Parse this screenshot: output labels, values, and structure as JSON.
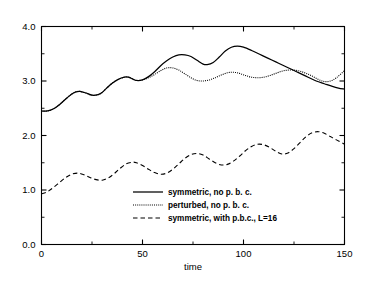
{
  "chart_data": {
    "type": "line",
    "title": "",
    "xlabel": "time",
    "ylabel": "",
    "xlim": [
      0,
      150
    ],
    "ylim": [
      0,
      4.0
    ],
    "grid": false,
    "legend_position": "lower-center",
    "x_ticks": [
      0,
      50,
      100,
      150
    ],
    "x_tick_labels": [
      "0",
      "50",
      "100",
      "150"
    ],
    "x_minor_ticks": [
      25,
      75,
      125
    ],
    "y_ticks": [
      0.0,
      1.0,
      2.0,
      3.0,
      4.0
    ],
    "y_tick_labels": [
      "0.0",
      "1.0",
      "2.0",
      "3.0",
      "4.0"
    ],
    "y_minor_ticks": [
      0.5,
      1.5,
      2.5,
      3.5
    ],
    "series": [
      {
        "name": "symmetric, no p. b. c.",
        "style": "solid",
        "color": "#000000",
        "x": [
          0,
          3,
          6,
          9,
          12,
          15,
          17,
          19,
          22,
          25,
          28,
          30,
          32,
          35,
          38,
          41,
          43,
          45,
          47,
          50,
          53,
          56,
          59,
          62,
          65,
          68,
          71,
          74,
          77,
          80,
          82,
          85,
          88,
          91,
          94,
          97,
          100,
          104,
          108,
          112,
          116,
          120,
          124,
          128,
          132,
          136,
          140,
          144,
          147,
          150
        ],
        "y": [
          2.45,
          2.45,
          2.49,
          2.57,
          2.67,
          2.76,
          2.8,
          2.81,
          2.78,
          2.74,
          2.75,
          2.79,
          2.86,
          2.96,
          3.03,
          3.07,
          3.07,
          3.04,
          3.01,
          3.02,
          3.08,
          3.17,
          3.28,
          3.37,
          3.44,
          3.48,
          3.48,
          3.45,
          3.38,
          3.31,
          3.3,
          3.34,
          3.44,
          3.55,
          3.62,
          3.64,
          3.62,
          3.56,
          3.49,
          3.42,
          3.35,
          3.28,
          3.21,
          3.14,
          3.07,
          3.0,
          2.95,
          2.9,
          2.87,
          2.85
        ]
      },
      {
        "name": "perturbed, no p. b. c.",
        "style": "dotted",
        "color": "#000000",
        "x": [
          0,
          3,
          6,
          9,
          12,
          15,
          17,
          19,
          22,
          25,
          28,
          30,
          32,
          35,
          38,
          41,
          43,
          45,
          47,
          50,
          53,
          56,
          59,
          62,
          65,
          68,
          71,
          74,
          77,
          80,
          83,
          86,
          89,
          92,
          95,
          98,
          101,
          104,
          107,
          110,
          113,
          116,
          119,
          122,
          125,
          128,
          131,
          134,
          137,
          140,
          143,
          146,
          150
        ],
        "y": [
          2.45,
          2.45,
          2.49,
          2.57,
          2.67,
          2.76,
          2.8,
          2.81,
          2.78,
          2.74,
          2.75,
          2.79,
          2.86,
          2.96,
          3.03,
          3.07,
          3.07,
          3.04,
          3.01,
          3.02,
          3.06,
          3.12,
          3.19,
          3.24,
          3.24,
          3.2,
          3.13,
          3.06,
          3.01,
          3.0,
          3.02,
          3.06,
          3.11,
          3.15,
          3.16,
          3.14,
          3.1,
          3.07,
          3.06,
          3.07,
          3.1,
          3.14,
          3.18,
          3.2,
          3.2,
          3.18,
          3.14,
          3.09,
          3.03,
          2.99,
          3.0,
          3.06,
          3.19
        ]
      },
      {
        "name": "symmetric, with p.b.c., L=16",
        "style": "dashed",
        "color": "#000000",
        "x": [
          0,
          3,
          6,
          9,
          12,
          15,
          18,
          21,
          24,
          27,
          30,
          33,
          36,
          39,
          42,
          45,
          47,
          50,
          53,
          56,
          59,
          62,
          65,
          68,
          71,
          74,
          77,
          80,
          83,
          86,
          89,
          92,
          95,
          98,
          101,
          104,
          107,
          110,
          113,
          116,
          119,
          122,
          125,
          128,
          131,
          134,
          137,
          140,
          143,
          146,
          150
        ],
        "y": [
          0.93,
          0.97,
          1.05,
          1.14,
          1.23,
          1.29,
          1.31,
          1.28,
          1.23,
          1.19,
          1.18,
          1.22,
          1.3,
          1.4,
          1.48,
          1.51,
          1.5,
          1.45,
          1.38,
          1.32,
          1.29,
          1.31,
          1.38,
          1.48,
          1.58,
          1.65,
          1.67,
          1.64,
          1.57,
          1.5,
          1.46,
          1.47,
          1.53,
          1.62,
          1.72,
          1.8,
          1.84,
          1.83,
          1.78,
          1.71,
          1.66,
          1.68,
          1.76,
          1.87,
          1.98,
          2.05,
          2.07,
          2.04,
          1.98,
          1.92,
          1.84
        ]
      }
    ]
  },
  "legend": {
    "entries": [
      {
        "label": "symmetric, no p. b. c.",
        "style": "solid"
      },
      {
        "label": "perturbed, no p. b. c.",
        "style": "dotted"
      },
      {
        "label": "symmetric, with p.b.c., L=16",
        "style": "dashed"
      }
    ]
  }
}
